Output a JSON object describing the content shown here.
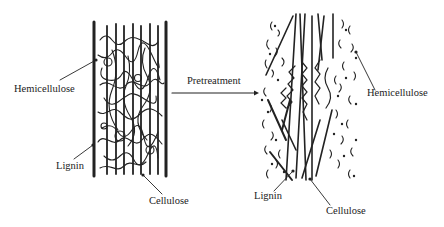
{
  "diagram": {
    "type": "schematic",
    "before": {
      "labels": {
        "hemicellulose": "Hemicellulose",
        "lignin": "Lignin",
        "cellulose": "Cellulose"
      }
    },
    "process": {
      "arrow_label": "Pretreatment"
    },
    "after": {
      "labels": {
        "hemicellulose": "Hemicellulose",
        "lignin": "Lignin",
        "cellulose": "Cellulose"
      }
    },
    "colors": {
      "ink": "#222222",
      "background": "#ffffff"
    }
  }
}
